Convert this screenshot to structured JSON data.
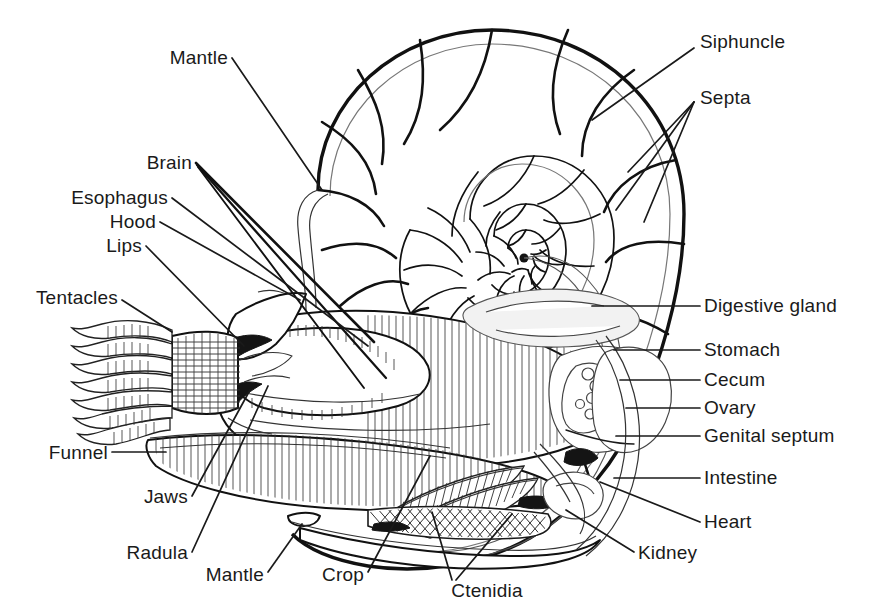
{
  "figure": {
    "ink_color": "#1a1a1a",
    "background_color": "#ffffff"
  },
  "labels": {
    "mantle_top": "Mantle",
    "brain": "Brain",
    "esophagus": "Esophagus",
    "hood": "Hood",
    "lips": "Lips",
    "tentacles": "Tentacles",
    "funnel": "Funnel",
    "jaws": "Jaws",
    "radula": "Radula",
    "mantle_bottom": "Mantle",
    "crop": "Crop",
    "ctenidia": "Ctenidia",
    "siphuncle": "Siphuncle",
    "septa": "Septa",
    "digestive_gland": "Digestive gland",
    "stomach": "Stomach",
    "cecum": "Cecum",
    "ovary": "Ovary",
    "genital_septum": "Genital septum",
    "intestine": "Intestine",
    "heart": "Heart",
    "kidney": "Kidney"
  }
}
